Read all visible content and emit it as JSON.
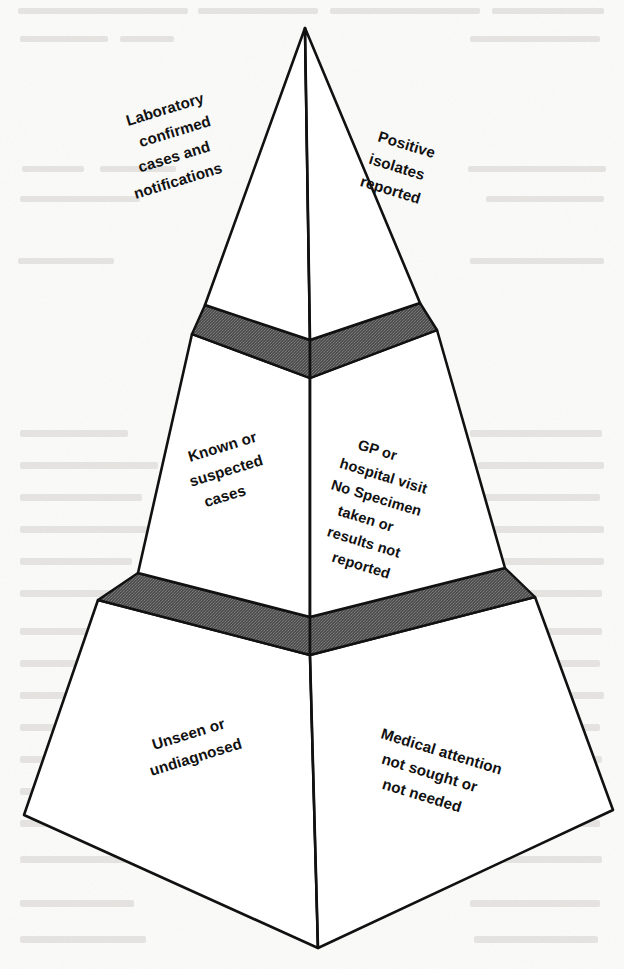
{
  "figure": {
    "type": "pyramid-diagram",
    "background_color": "#fbfbfa",
    "outline_color": "#111111",
    "tier_fill_color": "#ffffff",
    "band_fill_color": "#5a5a5a",
    "tiers": [
      {
        "id": "tier-top",
        "level": 1,
        "left_label": "Laboratory\nconfirmed\ncases and\nnotifications",
        "left_label_lines": [
          "Laboratory",
          "confirmed",
          "cases and",
          "notifications"
        ],
        "right_label": "Positive\nisolates\nreported",
        "right_label_lines": [
          "Positive",
          "isolates",
          "reported"
        ]
      },
      {
        "id": "tier-middle",
        "level": 2,
        "left_label": "Known or\nsuspected\ncases",
        "left_label_lines": [
          "Known or",
          "suspected",
          "cases"
        ],
        "right_label": "GP or\nhospital visit\nNo Specimen\ntaken or\nresults not\nreported",
        "right_label_lines": [
          "GP or",
          "hospital visit",
          "No Specimen",
          "taken or",
          "results not",
          "reported"
        ]
      },
      {
        "id": "tier-bottom",
        "level": 3,
        "left_label": "Unseen or\nundiagnosed",
        "left_label_lines": [
          "Unseen or",
          "undiagnosed"
        ],
        "right_label": "Medical attention\nnot sought or\nnot needed",
        "right_label_lines": [
          "Medical attention",
          "not sought or",
          "not needed"
        ]
      }
    ],
    "bands": [
      {
        "id": "band-upper",
        "between": "tier-top / tier-middle",
        "fill": "#5a5a5a"
      },
      {
        "id": "band-lower",
        "between": "tier-middle / tier-bottom",
        "fill": "#5a5a5a"
      }
    ],
    "labels_flat": {
      "t1_left_l1": "Laboratory",
      "t1_left_l2": "confirmed",
      "t1_left_l3": "cases and",
      "t1_left_l4": "notifications",
      "t1_right_l1": "Positive",
      "t1_right_l2": "isolates",
      "t1_right_l3": "reported",
      "t2_left_l1": "Known or",
      "t2_left_l2": "suspected",
      "t2_left_l3": "cases",
      "t2_right_l1": "GP or",
      "t2_right_l2": "hospital visit",
      "t2_right_l3": "No Specimen",
      "t2_right_l4": "taken or",
      "t2_right_l5": "results not",
      "t2_right_l6": "reported",
      "t3_left_l1": "Unseen or",
      "t3_left_l2": "undiagnosed",
      "t3_right_l1": "Medical attention",
      "t3_right_l2": "not sought or",
      "t3_right_l3": "not needed"
    }
  }
}
